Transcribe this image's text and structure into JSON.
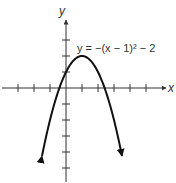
{
  "chart_data": {
    "type": "line",
    "title": "",
    "equation_label": "y = −(x − 1)² − 2",
    "xlabel": "x",
    "ylabel": "y",
    "xlim": [
      -4,
      6.5
    ],
    "ylim": [
      -5.8,
      4.2
    ],
    "x_ticks": [
      -3,
      -2,
      -1,
      1,
      2,
      3,
      4,
      5
    ],
    "y_ticks": [
      -5,
      -4,
      -3,
      -2,
      -1,
      1,
      2,
      3
    ],
    "tick_labels_shown": false,
    "grid": false,
    "series": [
      {
        "name": "parabola",
        "function": "-(x-1)^2 + 2 (as drawn; vertex at (1, 2))",
        "vertex": [
          1,
          2
        ],
        "x_range": [
          -1.5,
          3.5
        ],
        "arrows_at_ends": true,
        "x": [
          -1.5,
          -1,
          -0.5,
          0,
          0.5,
          1,
          1.5,
          2,
          2.5,
          3,
          3.5
        ],
        "y": [
          -4.25,
          -2,
          -0.25,
          1,
          1.75,
          2,
          1.75,
          1,
          -0.25,
          -2,
          -4.25
        ]
      }
    ],
    "colors": {
      "curve": "#111111",
      "axes": "#333333",
      "text": "#333333"
    }
  }
}
